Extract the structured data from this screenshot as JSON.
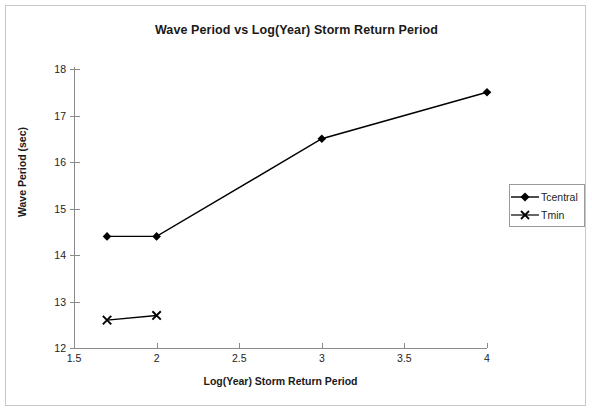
{
  "chart_data": {
    "type": "line",
    "title": "Wave Period vs Log(Year) Storm Return Period",
    "xlabel": "Log(Year) Storm Return Period",
    "ylabel": "Wave Period (sec)",
    "xlim": [
      1.5,
      4
    ],
    "ylim": [
      12,
      18
    ],
    "xticks": [
      1.5,
      2,
      2.5,
      3,
      3.5,
      4
    ],
    "xtick_labels": [
      "1.5",
      "2",
      "2.5",
      "3",
      "3.5",
      "4"
    ],
    "yticks": [
      12,
      13,
      14,
      15,
      16,
      17,
      18
    ],
    "ytick_labels": [
      "12",
      "13",
      "14",
      "15",
      "16",
      "17",
      "18"
    ],
    "grid": false,
    "legend_position": "right",
    "series": [
      {
        "name": "Tcentral",
        "marker": "diamond",
        "color": "#000000",
        "x": [
          1.7,
          2.0,
          3.0,
          4.0
        ],
        "values": [
          14.4,
          14.4,
          16.5,
          17.5
        ]
      },
      {
        "name": "Tmin",
        "marker": "x-cross",
        "color": "#000000",
        "x": [
          1.7,
          2.0
        ],
        "values": [
          12.6,
          12.7
        ]
      }
    ]
  },
  "legend": {
    "entries": [
      {
        "label": "Tcentral",
        "marker": "diamond-marker-icon"
      },
      {
        "label": "Tmin",
        "marker": "x-cross-marker-icon"
      }
    ]
  },
  "colors": {
    "series": "#000000",
    "axis": "#8a8a8a",
    "text": "#232323",
    "title": "#1a1a1a",
    "frame_border": "#c8c8c8",
    "legend_border": "#9a9a9a",
    "background": "#ffffff"
  }
}
